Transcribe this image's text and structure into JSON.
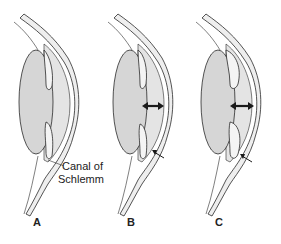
{
  "figure": {
    "panels": [
      {
        "id": "A",
        "label": "A",
        "x": 0
      },
      {
        "id": "B",
        "label": "B",
        "x": 94
      },
      {
        "id": "C",
        "label": "C",
        "x": 182
      }
    ],
    "callout": {
      "line1": "Canal of",
      "line2": "Schlemm"
    },
    "colors": {
      "lens_fill": "#d6d6d6",
      "chamber_fill": "#e4e4e4",
      "cornea_fill": "#eeeeee",
      "outline": "#2a2a2a",
      "background": "#ffffff"
    }
  }
}
